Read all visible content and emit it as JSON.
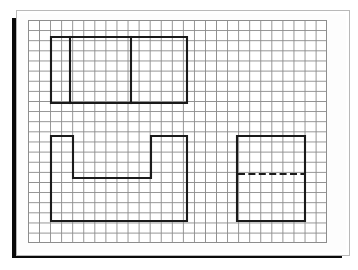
{
  "document": {
    "kind": "engineering-drawing",
    "medium": "graph-paper-sheet",
    "title": "Orthographic Projection Sketch",
    "caption": ""
  },
  "sheet": {
    "background_color": "#fdfdfd",
    "outline_color": "#b9b9b9",
    "shadow_color": "#0a0a0a"
  },
  "grid": {
    "label": "graph-paper-grid",
    "columns": 27,
    "rows": 22,
    "cell_width_px": 11.07,
    "cell_height_px": 10.14,
    "line_color": "#8d8d8d",
    "origin_x_px": 28,
    "origin_y_px": 20,
    "width_px": 299,
    "height_px": 223
  },
  "style": {
    "object_line_color": "#1a1a1a",
    "object_line_width_px": 2.1,
    "hidden_line_color": "#1a1a1a",
    "hidden_line_width_px": 1.9,
    "hidden_dash_pattern": "7 3.4"
  },
  "views": [
    {
      "id": "top-view",
      "name": "top-view",
      "label": "Top view",
      "shape": "rectangle-with-two-internal-vertical-lines",
      "outline_points": "51,37 187,37 187,103 51,103 51,37",
      "internal_lines": [
        {
          "name": "internal-vertical-line-left",
          "points": "70,37 70,103"
        },
        {
          "name": "internal-vertical-line-right",
          "points": "131,37 131,103"
        }
      ],
      "bounds": {
        "x": 51,
        "y": 37,
        "width": 136,
        "height": 66
      },
      "grid_span": {
        "columns": 12,
        "rows": 6
      }
    },
    {
      "id": "front-view",
      "name": "front-view",
      "label": "Front view",
      "shape": "rectangle-with-top-notch",
      "outline_points": "51,136 73,136 73,178 151,178 151,136 187,136 187,221 51,221 51,136",
      "internal_lines": [],
      "bounds": {
        "x": 51,
        "y": 136,
        "width": 136,
        "height": 85
      },
      "notch": {
        "x": 73,
        "y": 136,
        "width": 78,
        "depth": 42
      },
      "grid_span": {
        "columns": 12,
        "rows": 8
      }
    },
    {
      "id": "side-view",
      "name": "side-view",
      "label": "Right side view",
      "shape": "rectangle-with-horizontal-hidden-line",
      "outline_points": "237,136 305,136 305,221 237,221 237,136",
      "internal_lines": [],
      "hidden_lines": [
        {
          "name": "hidden-edge-line",
          "points": "238,174 304,174"
        }
      ],
      "bounds": {
        "x": 237,
        "y": 136,
        "width": 68,
        "height": 85
      },
      "grid_span": {
        "columns": 6,
        "rows": 8
      }
    }
  ]
}
